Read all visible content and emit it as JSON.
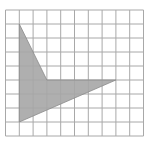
{
  "diagram": {
    "type": "grid-polygon",
    "grid": {
      "origin_px": [
        5.5,
        10
      ],
      "cell_px": [
        13.8,
        14
      ],
      "columns": 10,
      "rows": 9,
      "line_color": "#a8a8a8",
      "background": "#ffffff"
    },
    "polygon": {
      "vertices_grid": [
        [
          1,
          1
        ],
        [
          3,
          5
        ],
        [
          8,
          5
        ],
        [
          1,
          8
        ]
      ],
      "fill": "#a6a6a6",
      "stroke": "#8a8a8a"
    }
  }
}
